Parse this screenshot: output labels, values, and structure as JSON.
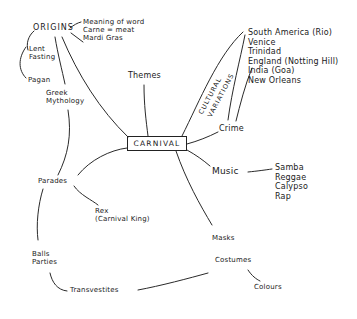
{
  "diagram": {
    "type": "mind-map",
    "center": "CARNIVAL",
    "branches": {
      "origins": {
        "label": "ORIGINS",
        "children": [
          "Meaning of word",
          "Carne = meat",
          "Mardi Gras"
        ],
        "related": [
          "Lent",
          "Fasting",
          "Pagan",
          "Greek",
          "Mythology"
        ]
      },
      "lent": {
        "line1": "Lent",
        "line2": "Fasting"
      },
      "pagan": "Pagan",
      "greek": {
        "line1": "Greek",
        "line2": "Mythology"
      },
      "themes": "Themes",
      "cultural_variations": {
        "line1": "CULTURAL",
        "line2": "VARIATIONS"
      },
      "places": [
        "South America (Rio)",
        "Venice",
        "Trinidad",
        "England (Notting Hill)",
        "India (Goa)",
        "New Orleans"
      ],
      "crime": "Crime",
      "music": {
        "label": "Music",
        "children": [
          "Samba",
          "Reggae",
          "Calypso",
          "Rap"
        ]
      },
      "parades": "Parades",
      "rex": {
        "line1": "Rex",
        "line2": "(Carnival King)"
      },
      "balls": {
        "line1": "Balls",
        "line2": "Parties"
      },
      "transvestites": "Transvestites",
      "masks": "Masks",
      "costumes": "Costumes",
      "colours": "Colours"
    },
    "colors": {
      "ink": "#2a2a2a",
      "background": "#ffffff"
    }
  }
}
